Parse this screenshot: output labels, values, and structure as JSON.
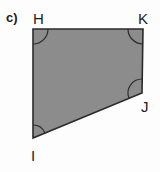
{
  "figure": {
    "part_label": "c)",
    "shape_name": "quadrilateral-HKJI",
    "fill_color": "#8c8c8c",
    "stroke_color": "#2b2b2b",
    "background_color": "#fdfdfd",
    "arc_color": "#2b2b2b",
    "vertices": [
      {
        "id": "H",
        "label": "H",
        "x": 33,
        "y": 29,
        "label_x": 33,
        "label_y": 11,
        "arc_radius": 15
      },
      {
        "id": "K",
        "label": "K",
        "x": 143,
        "y": 29,
        "label_x": 138,
        "label_y": 11,
        "arc_radius": 15
      },
      {
        "id": "J",
        "label": "J",
        "x": 142,
        "y": 93,
        "label_x": 141,
        "label_y": 99,
        "arc_radius": 14
      },
      {
        "id": "I",
        "label": "I",
        "x": 33,
        "y": 138,
        "label_x": 31,
        "label_y": 148,
        "arc_radius": 13
      }
    ],
    "edges": [
      {
        "from": "H",
        "to": "K"
      },
      {
        "from": "K",
        "to": "J"
      },
      {
        "from": "J",
        "to": "I"
      },
      {
        "from": "I",
        "to": "H"
      }
    ],
    "polygon_points": "33,29 143,29 142,93 33,138"
  }
}
